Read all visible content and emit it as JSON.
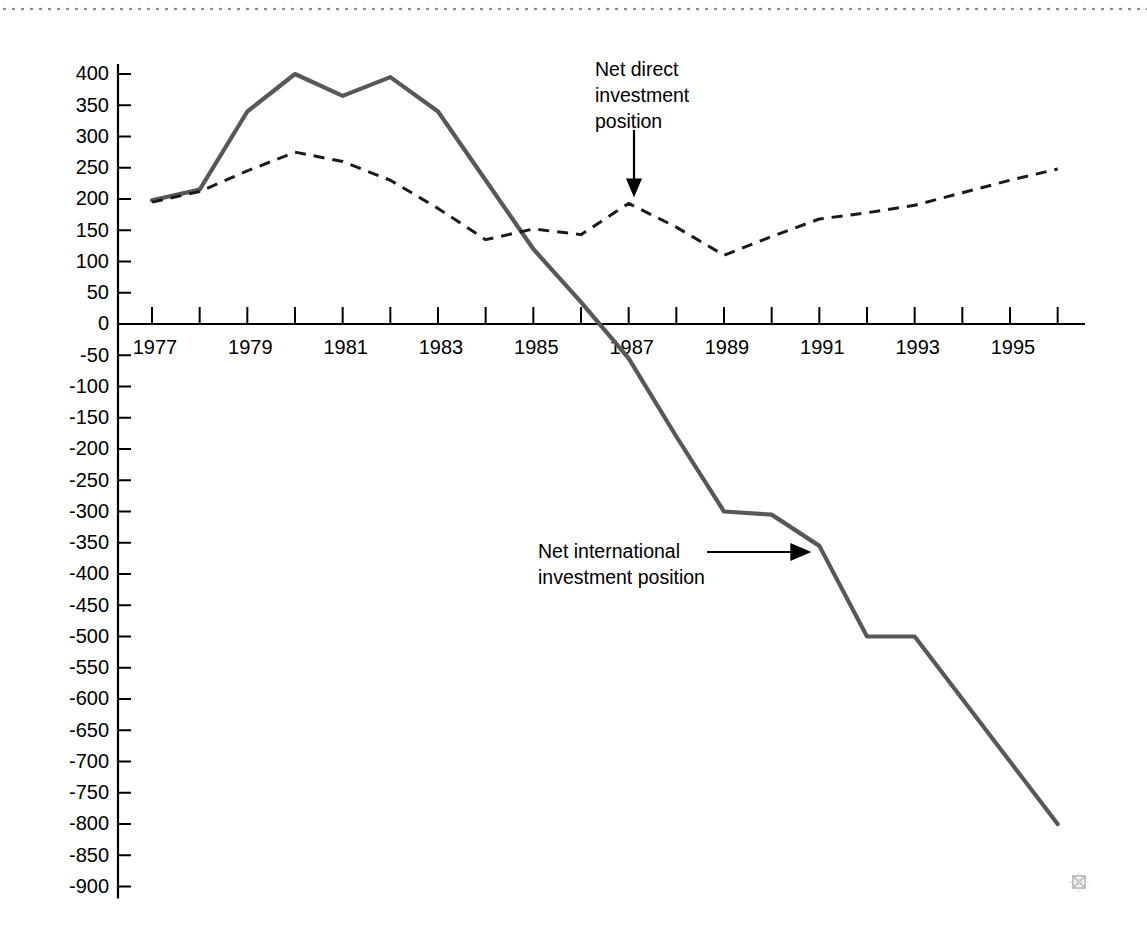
{
  "chart_data": {
    "type": "line",
    "title": "",
    "subtitle": "",
    "xlabel": "",
    "ylabel": "",
    "grid": false,
    "legend_position": "inline-annotations",
    "x": [
      1977,
      1978,
      1979,
      1980,
      1981,
      1982,
      1983,
      1984,
      1985,
      1986,
      1987,
      1988,
      1989,
      1990,
      1991,
      1992,
      1993,
      1994,
      1995,
      1996
    ],
    "x_tick_labels": [
      "1977",
      "1979",
      "1981",
      "1983",
      "1985",
      "1987",
      "1989",
      "1991",
      "1993",
      "1995"
    ],
    "x_labeled_years": [
      1977,
      1979,
      1981,
      1983,
      1985,
      1987,
      1989,
      1991,
      1993,
      1995
    ],
    "xlim": [
      1977,
      1997
    ],
    "ylim": [
      -900,
      400
    ],
    "y_ticks": [
      400,
      350,
      300,
      250,
      200,
      150,
      100,
      50,
      0,
      -50,
      -100,
      -150,
      -200,
      -250,
      -300,
      -350,
      -400,
      -450,
      -500,
      -550,
      -600,
      -650,
      -700,
      -750,
      -800,
      -850,
      -900
    ],
    "y_tick_labels": [
      "400",
      "350",
      "300",
      "250",
      "200",
      "150",
      "100",
      "50",
      "0",
      "-50",
      "-100",
      "-150",
      "-200",
      "-250",
      "-300",
      "-350",
      "-400",
      "-450",
      "-500",
      "-550",
      "-600",
      "-650",
      "-700",
      "-750",
      "-800",
      "-850",
      "-900"
    ],
    "series": [
      {
        "name": "Net international investment position",
        "style": "solid",
        "color": "#585858",
        "values": [
          198,
          215,
          340,
          400,
          365,
          395,
          340,
          230,
          120,
          35,
          -55,
          -180,
          -300,
          -305,
          -355,
          -500,
          -500,
          -600,
          -700,
          -800
        ]
      },
      {
        "name": "Net direct investment position",
        "style": "dashed",
        "color": "#1a1a1a",
        "values": [
          195,
          212,
          245,
          275,
          260,
          230,
          185,
          135,
          152,
          143,
          193,
          155,
          110,
          140,
          168,
          178,
          190,
          210,
          230,
          248
        ]
      }
    ],
    "annotations": [
      {
        "id": "net-direct-investment-position",
        "lines": [
          "Net direct",
          "investment",
          "position"
        ],
        "text": "Net direct investment position",
        "arrow": "down",
        "points_to_year": 1987,
        "points_to_value": 193
      },
      {
        "id": "net-international-investment-position",
        "lines": [
          "Net international",
          "investment position"
        ],
        "text": "Net international investment position",
        "arrow": "right",
        "points_to_year": 1991,
        "points_to_value": -355
      }
    ]
  },
  "decorations": {
    "top_rule": "dotted-rule",
    "corner_mark": "ornament-mark"
  }
}
